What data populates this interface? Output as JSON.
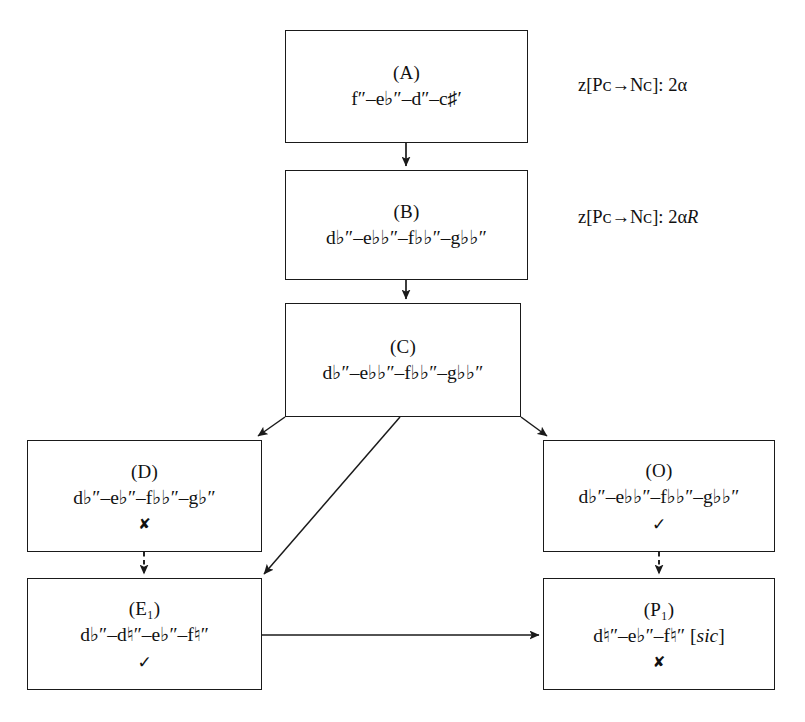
{
  "diagram": {
    "type": "flowchart",
    "background": "#ffffff",
    "line_color": "#1a1a1a",
    "nodes": [
      {
        "id": "A",
        "label": "(A)",
        "pitches": "f″–e♭″–d″–c♯′",
        "mark": "",
        "x": 285,
        "y": 30,
        "w": 243,
        "h": 113
      },
      {
        "id": "B",
        "label": "(B)",
        "pitches": "d♭″–e♭♭″–f♭♭″–g♭♭″",
        "mark": "",
        "x": 285,
        "y": 170,
        "w": 243,
        "h": 110
      },
      {
        "id": "C",
        "label": "(C)",
        "pitches": "d♭″–e♭♭″–f♭♭″–g♭♭″",
        "mark": "",
        "x": 285,
        "y": 303,
        "w": 236,
        "h": 114
      },
      {
        "id": "D",
        "label": "(D)",
        "pitches": "d♭″–e♭″–f♭♭″–g♭″",
        "mark": "✘",
        "mark_type": "cross",
        "x": 27,
        "y": 440,
        "w": 235,
        "h": 112
      },
      {
        "id": "O",
        "label": "(O)",
        "pitches": "d♭″–e♭♭″–f♭♭″–g♭♭″",
        "mark": "✓",
        "mark_type": "check",
        "x": 543,
        "y": 440,
        "w": 232,
        "h": 112
      },
      {
        "id": "E1",
        "label": "(E₁)",
        "pitches": "d♭″–d♮″–e♭″–f♮″",
        "mark": "✓",
        "mark_type": "check",
        "x": 27,
        "y": 578,
        "w": 235,
        "h": 112
      },
      {
        "id": "P1",
        "label": "(P₁)",
        "pitches": "d♮″–e♭″–f♮″ [sic]",
        "mark": "✘",
        "mark_type": "cross",
        "x": 543,
        "y": 578,
        "w": 232,
        "h": 112
      }
    ],
    "annotations": [
      {
        "id": "note-a",
        "text": "z[Pᴄ→Nᴄ]: 2α",
        "x": 578,
        "y": 75
      },
      {
        "id": "note-b",
        "text": "z[Pᴄ→Nᴄ]: 2αR",
        "x": 578,
        "y": 207
      }
    ],
    "edges": [
      {
        "from": "A",
        "to": "B",
        "style": "solid"
      },
      {
        "from": "B",
        "to": "C",
        "style": "solid"
      },
      {
        "from": "C",
        "to": "D",
        "style": "solid"
      },
      {
        "from": "C",
        "to": "E1",
        "style": "solid"
      },
      {
        "from": "C",
        "to": "O",
        "style": "solid"
      },
      {
        "from": "D",
        "to": "E1",
        "style": "dashed"
      },
      {
        "from": "O",
        "to": "P1",
        "style": "dashed"
      },
      {
        "from": "E1",
        "to": "P1",
        "style": "solid"
      }
    ]
  }
}
